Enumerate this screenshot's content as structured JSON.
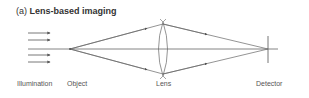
{
  "title": {
    "prefix": "(a) ",
    "text": "Lens-based imaging"
  },
  "labels": {
    "illumination": "Illumination",
    "object": "Object",
    "lens": "Lens",
    "detector": "Detector"
  },
  "colors": {
    "line": "#555555",
    "text": "#555555",
    "title": "#333333"
  }
}
